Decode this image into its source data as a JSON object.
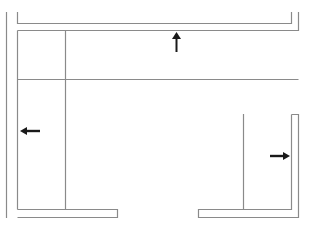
{
  "diagram": {
    "title": "",
    "line_color": "#8a8a8a",
    "arrow_color": "#1a1a1a",
    "arrows": [
      {
        "name": "up",
        "direction": "up"
      },
      {
        "name": "left",
        "direction": "left"
      },
      {
        "name": "right",
        "direction": "right"
      }
    ]
  }
}
